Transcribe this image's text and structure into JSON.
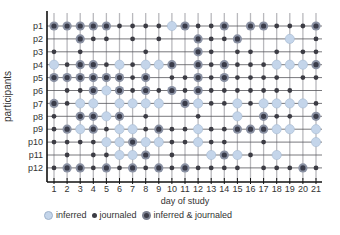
{
  "chart_data": {
    "type": "scatter",
    "subtype": "dot-matrix",
    "title": "",
    "xlabel": "day of study",
    "ylabel": "participants",
    "x": [
      "1",
      "2",
      "3",
      "4",
      "5",
      "6",
      "7",
      "8",
      "9",
      "10",
      "11",
      "12",
      "13",
      "14",
      "15",
      "16",
      "17",
      "18",
      "19",
      "20",
      "21"
    ],
    "categories": [
      "p1",
      "p2",
      "p3",
      "p4",
      "p5",
      "p6",
      "p7",
      "p8",
      "p9",
      "p10",
      "p11",
      "p12"
    ],
    "legend": [
      {
        "code": "I",
        "label": "inferred",
        "color": "#c4d5ea"
      },
      {
        "code": "J",
        "label": "journaled",
        "color": "#3c3c44"
      },
      {
        "code": "B",
        "label": "inferred & journaled",
        "color": "#7c8191"
      }
    ],
    "legend_position": "bottom",
    "grid": true,
    "rows": [
      {
        "participant": "p1",
        "days": [
          "B",
          "B",
          "B",
          "B",
          "B",
          "J",
          "J",
          "J",
          "J",
          "I",
          "B",
          "J",
          "J",
          "B",
          "",
          "B",
          "B",
          "J",
          "J",
          "J",
          "B"
        ]
      },
      {
        "participant": "p2",
        "days": [
          "",
          "",
          "B",
          "J",
          "J",
          "",
          "J",
          "",
          "J",
          "",
          "",
          "B",
          "J",
          "J",
          "B",
          "",
          "",
          "",
          "I",
          "",
          "J"
        ]
      },
      {
        "participant": "p3",
        "days": [
          "J",
          "",
          "J",
          "",
          "",
          "",
          "",
          "J",
          "",
          "",
          "",
          "B",
          "J",
          "",
          "J",
          "J",
          "",
          "J",
          "",
          "J",
          "J"
        ]
      },
      {
        "participant": "p4",
        "days": [
          "I",
          "J",
          "B",
          "B",
          "J",
          "I",
          "J",
          "I",
          "I",
          "B",
          "",
          "B",
          "J",
          "B",
          "J",
          "J",
          "J",
          "I",
          "I",
          "I",
          "B"
        ]
      },
      {
        "participant": "p5",
        "days": [
          "B",
          "B",
          "B",
          "B",
          "B",
          "B",
          "J",
          "B",
          "",
          "J",
          "J",
          "B",
          "J",
          "B",
          "J",
          "J",
          "J",
          "J",
          "",
          "J",
          "J"
        ]
      },
      {
        "participant": "p6",
        "days": [
          "",
          "J",
          "J",
          "B",
          "I",
          "B",
          "J",
          "B",
          "J",
          "B",
          "J",
          "B",
          "J",
          "J",
          "J",
          "J",
          "J",
          "J",
          "J",
          "",
          ""
        ]
      },
      {
        "participant": "p7",
        "days": [
          "B",
          "J",
          "I",
          "I",
          "",
          "I",
          "I",
          "I",
          "I",
          "",
          "B",
          "I",
          "J",
          "J",
          "I",
          "J",
          "I",
          "I",
          "I",
          "I",
          "J"
        ]
      },
      {
        "participant": "p8",
        "days": [
          "J",
          "",
          "B",
          "B",
          "I",
          "B",
          "",
          "J",
          "",
          "",
          "",
          "J",
          "",
          "",
          "I",
          "",
          "B",
          "J",
          "J",
          "",
          "B"
        ]
      },
      {
        "participant": "p9",
        "days": [
          "J",
          "B",
          "I",
          "B",
          "J",
          "I",
          "I",
          "J",
          "B",
          "J",
          "J",
          "I",
          "J",
          "J",
          "B",
          "B",
          "B",
          "I",
          "I",
          "",
          "I"
        ]
      },
      {
        "participant": "p10",
        "days": [
          "J",
          "J",
          "J",
          "J",
          "I",
          "I",
          "B",
          "I",
          "I",
          "J",
          "J",
          "I",
          "J",
          "J",
          "",
          "",
          "J",
          "",
          "",
          "",
          "I"
        ]
      },
      {
        "participant": "p11",
        "days": [
          "",
          "J",
          "",
          "J",
          "J",
          "I",
          "I",
          "B",
          "",
          "J",
          "",
          "",
          "I",
          "B",
          "I",
          "J",
          "",
          "I",
          "",
          "",
          ""
        ]
      },
      {
        "participant": "p12",
        "days": [
          "J",
          "B",
          "B",
          "J",
          "B",
          "J",
          "B",
          "J",
          "B",
          "J",
          "B",
          "J",
          "J",
          "J",
          "J",
          "",
          "J",
          "J",
          "J",
          "B",
          "J"
        ]
      }
    ]
  },
  "legend": {
    "inferred": "inferred",
    "journaled": "journaled",
    "both": "inferred & journaled"
  }
}
